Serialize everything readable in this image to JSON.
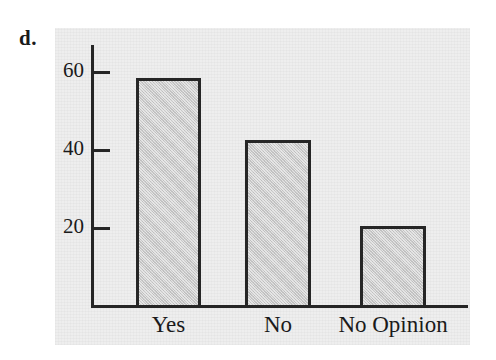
{
  "figure": {
    "part_label": "d.",
    "background_color": "#ffffff",
    "panel_color": "#eeeeee",
    "axis_color": "#262626",
    "bar_fill_color": "#c9c9c9",
    "bar_border_color": "#262626"
  },
  "chart_data": {
    "type": "bar",
    "title": "",
    "xlabel": "",
    "ylabel": "",
    "categories": [
      "Yes",
      "No",
      "No Opinion"
    ],
    "values": [
      58.5,
      42.5,
      20.5
    ],
    "ylim": [
      0,
      66
    ],
    "yticks": [
      20,
      40,
      60
    ],
    "ytick_labels": [
      "20",
      "40",
      "60"
    ],
    "grid": false,
    "legend": null
  }
}
